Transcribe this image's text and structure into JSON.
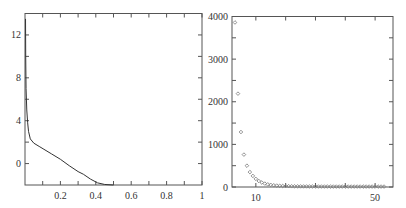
{
  "chart_data": [
    {
      "type": "line",
      "title": "",
      "xlabel": "",
      "ylabel": "",
      "xlim": [
        0,
        1
      ],
      "ylim": [
        -2,
        14
      ],
      "grid": false,
      "x_ticks": [
        0.2,
        0.4,
        0.6,
        0.8,
        1
      ],
      "x_tick_labels": [
        "0.2",
        "0.4",
        "0.6",
        "0.8",
        "1"
      ],
      "x_minor_ticks": [
        0.1,
        0.3,
        0.5,
        0.7,
        0.9
      ],
      "y_ticks": [
        0,
        4,
        8,
        12
      ],
      "y_tick_labels": [
        "0",
        "4",
        "8",
        "12"
      ],
      "y_minor_ticks": [
        2,
        6,
        10
      ],
      "series": [
        {
          "name": "curve",
          "x": [
            0.003,
            0.004,
            0.006,
            0.01,
            0.015,
            0.02,
            0.03,
            0.05,
            0.08,
            0.107,
            0.15,
            0.2,
            0.25,
            0.3,
            0.33,
            0.37,
            0.41,
            0.45,
            0.5
          ],
          "y": [
            13.5,
            10,
            7,
            5,
            3.8,
            3.0,
            2.3,
            1.9,
            1.6,
            1.33,
            0.9,
            0.4,
            -0.2,
            -0.75,
            -1.0,
            -1.45,
            -1.8,
            -1.95,
            -2.0
          ]
        }
      ]
    },
    {
      "type": "scatter",
      "title": "",
      "xlabel": "",
      "ylabel": "",
      "xlim": [
        2,
        56
      ],
      "ylim": [
        0,
        4000
      ],
      "grid": false,
      "marker": "diamond",
      "x_ticks": [
        10,
        50
      ],
      "x_tick_labels": [
        "10",
        "50"
      ],
      "x_minor_ticks": [
        20,
        30,
        40
      ],
      "y_ticks": [
        0,
        1000,
        2000,
        3000,
        4000
      ],
      "y_tick_labels": [
        "0",
        "1000",
        "2000",
        "3000",
        "4000"
      ],
      "y_minor_ticks": [
        500,
        1500,
        2500,
        3500
      ],
      "series": [
        {
          "name": "points",
          "x": [
            3,
            4,
            5,
            6,
            7,
            8,
            9,
            10,
            11,
            12,
            13,
            14,
            15,
            16,
            17,
            18,
            19,
            20,
            21,
            22,
            23,
            24,
            25,
            26,
            27,
            28,
            29,
            30,
            31,
            32,
            33,
            34,
            35,
            36,
            37,
            38,
            39,
            40,
            41,
            42,
            43,
            44,
            45,
            46,
            47,
            48,
            49,
            50,
            51,
            52,
            53
          ],
          "y": [
            3860,
            2190,
            1290,
            760,
            500,
            350,
            260,
            190,
            140,
            105,
            80,
            62,
            50,
            40,
            33,
            28,
            24,
            21,
            19,
            17,
            16,
            15,
            14,
            13,
            13,
            12,
            12,
            12,
            11,
            11,
            11,
            11,
            10,
            10,
            10,
            10,
            10,
            10,
            10,
            10,
            10,
            10,
            10,
            10,
            10,
            10,
            10,
            10,
            10,
            10,
            10
          ]
        }
      ]
    }
  ]
}
